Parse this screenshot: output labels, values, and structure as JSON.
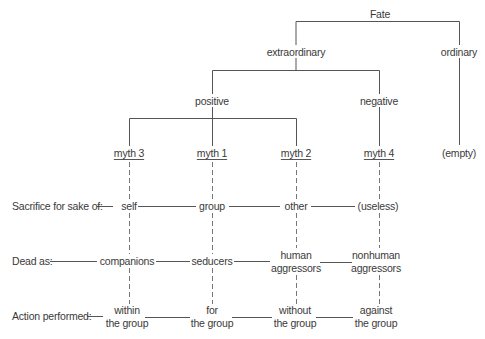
{
  "tree": {
    "root": "Fate",
    "level1": [
      "extraordinary",
      "ordinary"
    ],
    "level2": [
      "positive",
      "negative"
    ],
    "leaves": [
      "myth 3",
      "myth 1",
      "myth 2",
      "myth 4",
      "(empty)"
    ]
  },
  "rows": {
    "sacrifice": {
      "label": "Sacrifice for sake of:",
      "values": [
        "self",
        "group",
        "other",
        "(useless)"
      ]
    },
    "dead": {
      "label": "Dead as:",
      "values": [
        {
          "line1": "companions",
          "line2": ""
        },
        {
          "line1": "seducers",
          "line2": ""
        },
        {
          "line1": "human",
          "line2": "aggressors"
        },
        {
          "line1": "nonhuman",
          "line2": "aggressors"
        }
      ]
    },
    "action": {
      "label": "Action performed:",
      "values": [
        {
          "line1": "within",
          "line2": "the group"
        },
        {
          "line1": "for",
          "line2": "the group"
        },
        {
          "line1": "without",
          "line2": "the group"
        },
        {
          "line1": "against",
          "line2": "the group"
        }
      ]
    }
  },
  "colors": {
    "text": "#3a3a3a",
    "line": "#555555",
    "dashed": "#777777",
    "background": "#ffffff"
  }
}
